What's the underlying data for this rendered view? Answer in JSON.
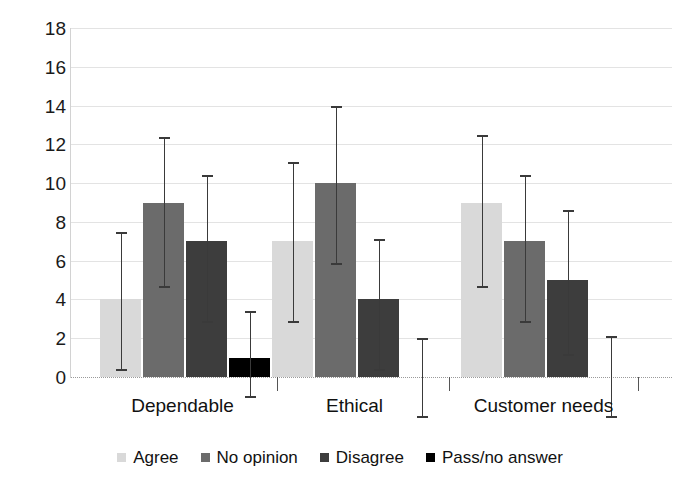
{
  "chart_data": {
    "type": "bar",
    "title": "",
    "subtitle": "",
    "xlabel": "",
    "ylabel": "",
    "categories": [
      "Dependable",
      "Ethical",
      "Customer needs"
    ],
    "ylim": [
      0,
      18
    ],
    "yticks": [
      0,
      2,
      4,
      6,
      8,
      10,
      12,
      14,
      16,
      18
    ],
    "ytick_labels": [
      "0",
      "2",
      "4",
      "6",
      "8",
      "10",
      "12",
      "14",
      "16",
      "18"
    ],
    "grid": true,
    "legend_position": "bottom",
    "error_bars": true,
    "series": [
      {
        "name": "Agree",
        "color": "#d9d9d9",
        "values": [
          4,
          7,
          9
        ],
        "err_low": [
          0.4,
          2.9,
          4.7
        ],
        "err_high": [
          7.5,
          11.1,
          12.5
        ]
      },
      {
        "name": "No opinion",
        "color": "#6b6b6b",
        "values": [
          9,
          10,
          7
        ],
        "err_low": [
          4.7,
          5.9,
          2.9
        ],
        "err_high": [
          12.4,
          14.0,
          10.4
        ]
      },
      {
        "name": "Disagree",
        "color": "#3d3d3d",
        "values": [
          7,
          4,
          5
        ],
        "err_low": [
          2.9,
          0.4,
          1.2
        ],
        "err_high": [
          10.4,
          7.1,
          8.6
        ]
      },
      {
        "name": "Pass/no answer",
        "color": "#000000",
        "values": [
          1,
          0,
          0
        ],
        "err_low": [
          -1.0,
          -2.0,
          -2.0
        ],
        "err_high": [
          3.4,
          2.0,
          2.1
        ]
      }
    ]
  },
  "legend": {
    "items": [
      {
        "label": "Agree",
        "color": "#d9d9d9"
      },
      {
        "label": "No opinion",
        "color": "#6b6b6b"
      },
      {
        "label": "Disagree",
        "color": "#3d3d3d"
      },
      {
        "label": "Pass/no answer",
        "color": "#000000"
      }
    ]
  }
}
